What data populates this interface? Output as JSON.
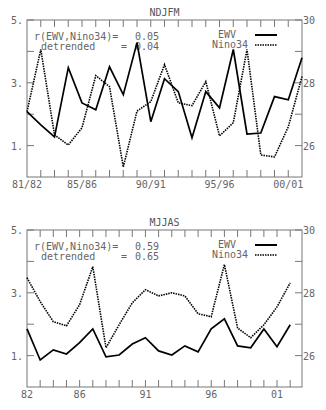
{
  "chart_data": [
    {
      "type": "line",
      "title": "NDJFM",
      "xlabel": "",
      "ylabel_left": "EWV",
      "ylabel_right": "Nino34",
      "x_tick_labels": [
        "81/82",
        "85/86",
        "90/91",
        "95/96",
        "00/01"
      ],
      "x": [
        "81/82",
        "82/83",
        "83/84",
        "84/85",
        "85/86",
        "86/87",
        "87/88",
        "88/89",
        "89/90",
        "90/91",
        "91/92",
        "92/93",
        "93/94",
        "94/95",
        "95/96",
        "96/97",
        "97/98",
        "98/99",
        "99/00",
        "00/01",
        "01/02"
      ],
      "ylim_left": [
        0,
        5
      ],
      "yticks_left": [
        "5.",
        "3.",
        "1."
      ],
      "ylim_right": [
        25,
        30
      ],
      "yticks_right": [
        "30",
        "28",
        "26"
      ],
      "legend": {
        "position": "upper right",
        "entries": [
          "EWV",
          "Nino34"
        ]
      },
      "annotation": {
        "line1_label": "r(EWV,Nino34)=",
        "line1_value": "0.05",
        "line2_label": "detrended     =",
        "line2_value": "0.04"
      },
      "series": [
        {
          "name": "EWV",
          "axis": "left",
          "style": "solid",
          "values": [
            2.08,
            1.66,
            1.28,
            3.48,
            2.36,
            2.14,
            3.51,
            2.62,
            4.28,
            1.76,
            3.13,
            2.72,
            1.25,
            2.72,
            2.2,
            4.06,
            1.37,
            1.4,
            2.56,
            2.46,
            3.8
          ]
        },
        {
          "name": "Nino34",
          "axis": "right",
          "style": "dotted",
          "values": [
            27.08,
            29.06,
            26.34,
            26.02,
            26.57,
            28.23,
            27.88,
            25.32,
            27.1,
            27.4,
            28.58,
            27.36,
            27.27,
            28.04,
            26.31,
            26.73,
            29.06,
            25.7,
            25.64,
            26.6,
            28.2
          ]
        }
      ]
    },
    {
      "type": "line",
      "title": "MJJAS",
      "xlabel": "",
      "ylabel_left": "EWV",
      "ylabel_right": "Nino34",
      "x_tick_labels": [
        "82",
        "86",
        "91",
        "96",
        "01"
      ],
      "x": [
        "82",
        "83",
        "84",
        "85",
        "86",
        "87",
        "88",
        "89",
        "90",
        "91",
        "92",
        "93",
        "94",
        "95",
        "96",
        "97",
        "98",
        "99",
        "00",
        "01",
        "02"
      ],
      "ylim_left": [
        0,
        5
      ],
      "yticks_left": [
        "5.",
        "3.",
        "1."
      ],
      "ylim_right": [
        25,
        30
      ],
      "yticks_right": [
        "30",
        "28",
        "26"
      ],
      "legend": {
        "position": "upper right",
        "entries": [
          "EWV",
          "Nino34"
        ]
      },
      "annotation": {
        "line1_label": "r(EWV,Nino34)=",
        "line1_value": "0.59",
        "line2_label": "detrended     =",
        "line2_value": "0.65"
      },
      "series": [
        {
          "name": "EWV",
          "axis": "left",
          "style": "solid",
          "values": [
            1.85,
            0.86,
            1.18,
            1.05,
            1.41,
            1.85,
            0.96,
            1.02,
            1.37,
            1.57,
            1.15,
            1.02,
            1.31,
            1.12,
            1.85,
            2.17,
            1.31,
            1.25,
            1.85,
            1.28,
            1.98
          ]
        },
        {
          "name": "Nino34",
          "axis": "right",
          "style": "dotted",
          "values": [
            28.48,
            27.72,
            27.08,
            26.95,
            27.62,
            28.83,
            26.25,
            26.98,
            27.68,
            28.1,
            27.9,
            28.0,
            27.9,
            27.33,
            27.24,
            28.9,
            26.88,
            26.57,
            26.98,
            27.55,
            28.32
          ]
        }
      ]
    }
  ]
}
